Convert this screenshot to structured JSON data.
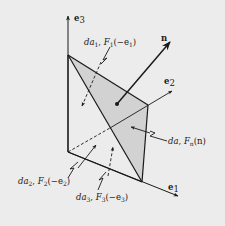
{
  "figure": {
    "type": "tetrahedron-traction-diagram",
    "axes": [
      {
        "id": "e3",
        "label_main": "e",
        "label_sub": "3"
      },
      {
        "id": "e2",
        "label_main": "e",
        "label_sub": "2"
      },
      {
        "id": "e1",
        "label_main": "e",
        "label_sub": "1"
      }
    ],
    "normal": {
      "label": "n"
    },
    "faces": [
      {
        "id": "da1",
        "area": "da",
        "area_sub": "1",
        "force": "F",
        "force_sub": "1",
        "arg": "(−e",
        "arg_sub": "1",
        "arg_close": ")"
      },
      {
        "id": "da2",
        "area": "da",
        "area_sub": "2",
        "force": "F",
        "force_sub": "2",
        "arg": "(−e",
        "arg_sub": "2",
        "arg_close": ")"
      },
      {
        "id": "da3",
        "area": "da",
        "area_sub": "3",
        "force": "F",
        "force_sub": "3",
        "arg": "(−e",
        "arg_sub": "3",
        "arg_close": ")"
      },
      {
        "id": "da",
        "area": "da",
        "force": "F",
        "force_sub": "n",
        "arg": "(n)"
      }
    ],
    "colors": {
      "background": "#ececec",
      "shade": "#d2d2d2",
      "line": "#1a1a1a"
    }
  }
}
